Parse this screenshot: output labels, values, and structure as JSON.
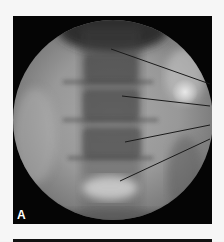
{
  "figure": {
    "panel_label": "A",
    "needle_count": 4,
    "colors": {
      "background_frame": "#050505",
      "field_of_view": "#8c8c8c",
      "needle": "#1a1a1a",
      "page": "#f6f6f6"
    }
  }
}
